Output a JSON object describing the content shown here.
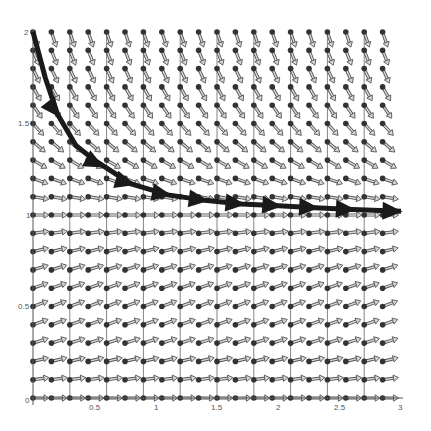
{
  "chart_data": {
    "type": "vector_field",
    "title": "",
    "xlabel": "",
    "ylabel": "",
    "xlim": [
      0,
      3
    ],
    "ylim": [
      0,
      2
    ],
    "grid": true,
    "x_ticks": [
      "0.5",
      "1",
      "1.5",
      "2",
      "2.5",
      "3"
    ],
    "y_ticks": [
      "0",
      "0.5",
      "1",
      "1.5",
      "2"
    ],
    "field": {
      "equation": "dy/dx = y(1 - y)",
      "x_step": 0.15,
      "y_step": 0.1,
      "columns": 20,
      "rows": 21
    },
    "solution_curve": {
      "initial_condition": [
        0,
        2
      ],
      "points": [
        [
          0.0,
          2.0
        ],
        [
          0.1,
          1.75
        ],
        [
          0.2,
          1.55
        ],
        [
          0.35,
          1.38
        ],
        [
          0.5,
          1.3
        ],
        [
          0.8,
          1.17
        ],
        [
          1.1,
          1.11
        ],
        [
          1.4,
          1.08
        ],
        [
          1.7,
          1.06
        ],
        [
          2.0,
          1.05
        ],
        [
          2.3,
          1.04
        ],
        [
          2.6,
          1.03
        ],
        [
          3.0,
          1.02
        ]
      ],
      "equilibrium": 1
    },
    "colors": {
      "field_arrow_fill": "#d8d8d8",
      "field_arrow_stroke": "#555555",
      "field_dot": "#333333",
      "curve": "#1a1a1a",
      "grid": "#777777",
      "axis": "#555555"
    }
  }
}
